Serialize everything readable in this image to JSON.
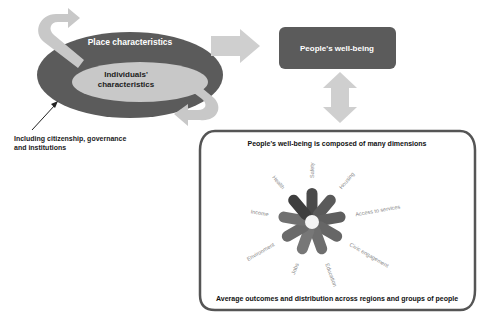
{
  "left_cluster": {
    "outer_label": "Place characteristics",
    "inner_label_line1": "Individuals'",
    "inner_label_line2": "characteristics",
    "note_line1": "Including citizenship, governance",
    "note_line2": "and institutions"
  },
  "wellbeing_box": {
    "label": "People's well-being"
  },
  "dimensions_panel": {
    "title": "People's well-being is composed of many dimensions",
    "footer": "Average outcomes and distribution across regions and groups of people",
    "dimensions": [
      {
        "label": "Safety",
        "color": "#4a4a4a"
      },
      {
        "label": "Housing",
        "color": "#5a5a5a"
      },
      {
        "label": "Access to services",
        "color": "#5e5e5e"
      },
      {
        "label": "Civic engagement",
        "color": "#666666"
      },
      {
        "label": "Education",
        "color": "#6e6e6e"
      },
      {
        "label": "Jobs",
        "color": "#777777"
      },
      {
        "label": "Environment",
        "color": "#6a6a6a"
      },
      {
        "label": "Income",
        "color": "#707070"
      },
      {
        "label": "Health",
        "color": "#3e3e3e"
      }
    ]
  },
  "colors": {
    "dark": "#5b5b5b",
    "light_gray": "#c8c8c8",
    "arrow_gray": "#cfcfcf",
    "panel_border": "#555555"
  }
}
